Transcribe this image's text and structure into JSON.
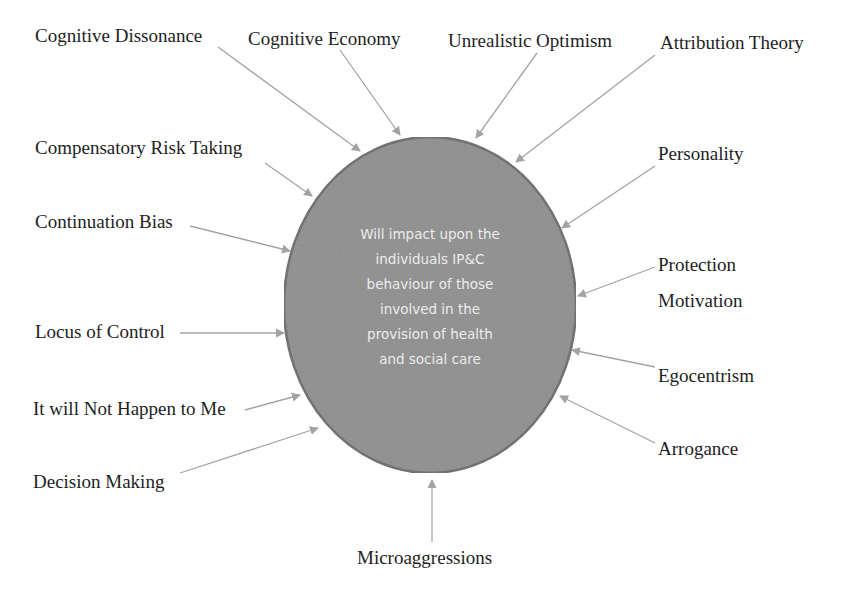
{
  "diagram": {
    "center": {
      "lines": [
        "Will impact upon the",
        "individuals IP&C",
        "behaviour of those",
        "involved in the",
        "provision of health",
        "and social care"
      ],
      "fill": "#8f8f8f",
      "stroke": "#6c6c6c",
      "text_color": "#ececec"
    },
    "arrow_color": "#a3a3a3",
    "factors": [
      {
        "label": "Cognitive Dissonance",
        "x": 35,
        "y": 25,
        "from": [
          218,
          47
        ],
        "to": [
          360,
          151
        ]
      },
      {
        "label": "Cognitive Economy",
        "x": 248,
        "y": 28,
        "from": [
          340,
          50
        ],
        "to": [
          400,
          135
        ]
      },
      {
        "label": "Unrealistic Optimism",
        "x": 448,
        "y": 30,
        "from": [
          537,
          53
        ],
        "to": [
          476,
          138
        ]
      },
      {
        "label": "Attribution Theory",
        "x": 660,
        "y": 32,
        "from": [
          655,
          55
        ],
        "to": [
          516,
          162
        ]
      },
      {
        "label": "Compensatory Risk Taking",
        "x": 35,
        "y": 137,
        "from": [
          265,
          163
        ],
        "to": [
          312,
          196
        ]
      },
      {
        "label": "Personality",
        "x": 658,
        "y": 143,
        "from": [
          655,
          166
        ],
        "to": [
          562,
          228
        ]
      },
      {
        "label": "Continuation Bias",
        "x": 35,
        "y": 211,
        "from": [
          190,
          226
        ],
        "to": [
          290,
          251
        ]
      },
      {
        "label": "Protection",
        "x": 658,
        "y": 254,
        "from": [
          655,
          267
        ],
        "to": [
          578,
          296
        ]
      },
      {
        "label": "Motivation",
        "x": 658,
        "y": 290,
        "from": null,
        "to": null
      },
      {
        "label": "Locus of Control",
        "x": 35,
        "y": 321,
        "from": [
          180,
          333
        ],
        "to": [
          284,
          333
        ]
      },
      {
        "label": "Egocentrism",
        "x": 658,
        "y": 365,
        "from": [
          655,
          367
        ],
        "to": [
          572,
          350
        ]
      },
      {
        "label": "It will Not Happen to Me",
        "x": 33,
        "y": 398,
        "from": [
          245,
          410
        ],
        "to": [
          300,
          395
        ]
      },
      {
        "label": "Arrogance",
        "x": 658,
        "y": 438,
        "from": [
          655,
          443
        ],
        "to": [
          560,
          396
        ]
      },
      {
        "label": "Decision Making",
        "x": 33,
        "y": 471,
        "from": [
          180,
          473
        ],
        "to": [
          318,
          428
        ]
      },
      {
        "label": "Microaggressions",
        "x": 357,
        "y": 547,
        "from": [
          432,
          542
        ],
        "to": [
          432,
          480
        ]
      }
    ]
  }
}
